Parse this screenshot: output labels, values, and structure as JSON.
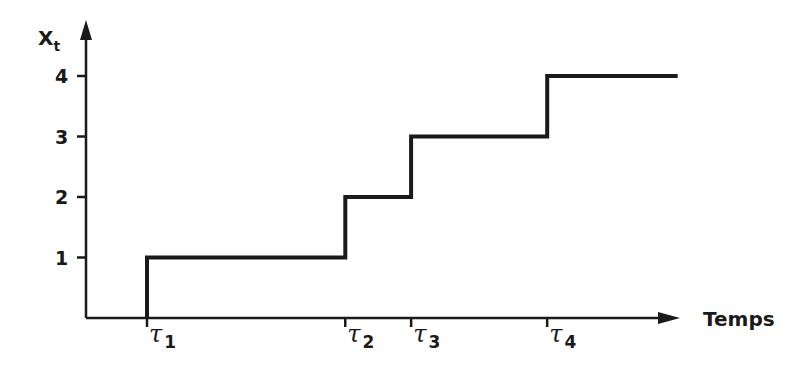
{
  "chart_data": {
    "type": "line",
    "subtype": "step",
    "title": "",
    "xlabel": "Temps",
    "ylabel": "X",
    "ylabel_subscript": "t",
    "x_ticks": [
      {
        "symbol": "τ",
        "index": "1",
        "x": 1
      },
      {
        "symbol": "τ",
        "index": "2",
        "x": 4.25
      },
      {
        "symbol": "τ",
        "index": "3",
        "x": 5.33
      },
      {
        "symbol": "τ",
        "index": "4",
        "x": 7.56
      }
    ],
    "y_ticks": [
      1,
      2,
      3,
      4
    ],
    "xlim": [
      0,
      9.7
    ],
    "ylim": [
      0,
      4.6
    ],
    "grid": false,
    "series": [
      {
        "name": "X_t",
        "step_points": [
          {
            "x": 1,
            "y": 0
          },
          {
            "x": 1,
            "y": 1
          },
          {
            "x": 4.25,
            "y": 1
          },
          {
            "x": 4.25,
            "y": 2
          },
          {
            "x": 5.33,
            "y": 2
          },
          {
            "x": 5.33,
            "y": 3
          },
          {
            "x": 7.56,
            "y": 3
          },
          {
            "x": 7.56,
            "y": 4
          },
          {
            "x": 9.7,
            "y": 4
          }
        ]
      }
    ],
    "colors": {
      "ink": "#1a1a1a",
      "background": "#ffffff"
    }
  }
}
